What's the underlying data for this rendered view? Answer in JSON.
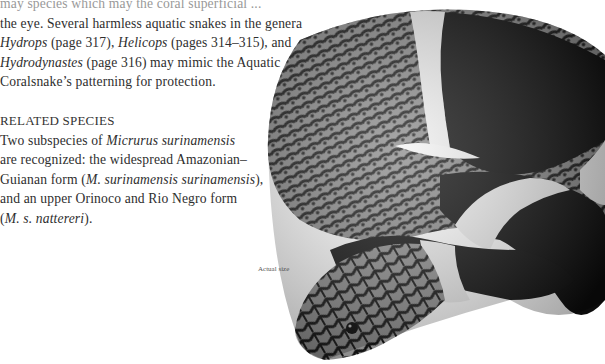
{
  "document": {
    "body_text": {
      "line_0_partial": "may species which may the coral superficial ...",
      "line_1": "the eye. Several harmless aquatic snakes in the genera",
      "line_2": {
        "genus_a": "Hydrops",
        "ref_a": " (page 317), ",
        "genus_b": "Helicops",
        "ref_b": " (pages 314–315), and"
      },
      "line_3": {
        "genus_c": "Hydrodynastes",
        "rest": " (page 316) may mimic the Aquatic"
      },
      "line_4": "Coralsnake’s patterning for protection."
    },
    "related_species": {
      "heading": "RELATED SPECIES",
      "line_1": {
        "pre": "Two subspecies of ",
        "species": "Micrurus surinamensis"
      },
      "line_2": "are recognized: the widespread Amazonian–",
      "line_3": {
        "pre": "Guianan form (",
        "name": "M. surinamensis surinamensis",
        "post": "),"
      },
      "line_4": "and an upper Orinoco and Rio Negro form",
      "line_5": {
        "pre": "(",
        "name": "M. s. nattereri",
        "post": ")."
      }
    },
    "figure": {
      "caption": "Actual size",
      "subject": "snake-photo",
      "colors": {
        "black_band": "#0a0a0a",
        "white_band": "#f2f2f2",
        "scale_gray": "#7a7a7a"
      }
    }
  }
}
